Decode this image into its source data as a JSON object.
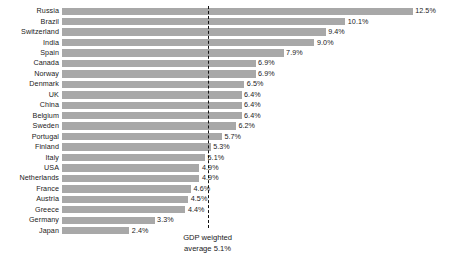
{
  "chart_data": {
    "type": "bar",
    "orientation": "horizontal",
    "title": "",
    "xlabel": "",
    "ylabel": "",
    "grid": false,
    "legend": null,
    "xlim": [
      0,
      12.5
    ],
    "value_suffix": "%",
    "categories": [
      "Russia",
      "Brazil",
      "Switzerland",
      "India",
      "Spain",
      "Canada",
      "Norway",
      "Denmark",
      "UK",
      "China",
      "Belgium",
      "Sweden",
      "Portugal",
      "Finland",
      "Italy",
      "USA",
      "Netherlands",
      "France",
      "Austria",
      "Greece",
      "Germany",
      "Japan"
    ],
    "values": [
      12.5,
      10.1,
      9.4,
      9.0,
      7.9,
      6.9,
      6.9,
      6.5,
      6.4,
      6.4,
      6.4,
      6.2,
      5.7,
      5.3,
      5.1,
      4.9,
      4.9,
      4.6,
      4.5,
      4.4,
      3.3,
      2.4
    ],
    "value_labels": [
      "12.5%",
      "10.1%",
      "9.4%",
      "9.0%",
      "7.9%",
      "6.9%",
      "6.9%",
      "6.5%",
      "6.4%",
      "6.4%",
      "6.4%",
      "6.2%",
      "5.7%",
      "5.3%",
      "5.1%",
      "4.9%",
      "4.9%",
      "4.6%",
      "4.5%",
      "4.4%",
      "3.3%",
      "2.4%"
    ],
    "reference_line": {
      "value": 5.1,
      "style": "dashed",
      "color": "#111111",
      "annotation_line1": "GDP weighted",
      "annotation_line2": "average 5.1%"
    },
    "colors": {
      "bar": "#a8a8a8",
      "text": "#1a1a1a",
      "background": "#ffffff"
    }
  }
}
